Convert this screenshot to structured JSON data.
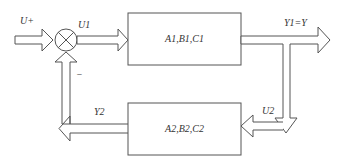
{
  "diagram": {
    "type": "feedback block diagram",
    "input_label": "U+",
    "sum_output_label": "U1",
    "feedback_sign": "−",
    "block1": {
      "label": "A1,B1,C1"
    },
    "output_label": "Y1=Y",
    "u2_label": "U2",
    "block2": {
      "label": "A2,B2,C2"
    },
    "feedback_label": "Y2",
    "colors": {
      "stroke": "#555555",
      "background": "#ffffff",
      "text": "#333333"
    }
  }
}
